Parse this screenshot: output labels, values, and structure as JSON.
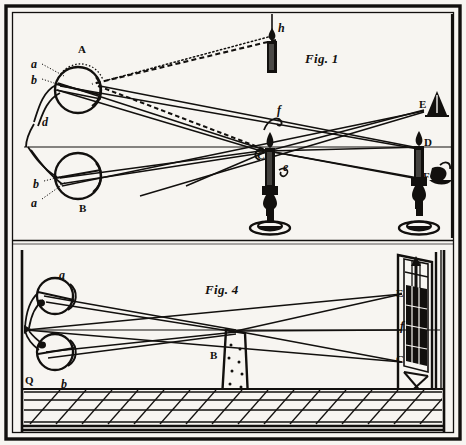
{
  "plate": {
    "title": "Optical diagram plate with two figures",
    "background_color": "#f7f5f1",
    "ink_color": "#12100e",
    "border": {
      "outer_stroke": 3,
      "inner_stroke": 1.2
    }
  },
  "figures": [
    {
      "id": "fig1",
      "caption": "Fig. 1",
      "caption_pos": {
        "x": 305,
        "y": 58
      },
      "description": "Two eyes at left viewing candles; rays converge at candle C",
      "labels": [
        {
          "name": "eye-a-upper",
          "text": "a",
          "style": "italic",
          "x": 31,
          "y": 64
        },
        {
          "name": "eye-b-upper",
          "text": "b",
          "style": "italic",
          "x": 31,
          "y": 80
        },
        {
          "name": "eye-A",
          "text": "A",
          "style": "capital",
          "x": 78,
          "y": 50
        },
        {
          "name": "eye-d",
          "text": "d",
          "style": "italic",
          "x": 42,
          "y": 122
        },
        {
          "name": "eye-b-lower",
          "text": "b",
          "style": "italic",
          "x": 33,
          "y": 184
        },
        {
          "name": "eye-a-lower",
          "text": "a",
          "style": "italic",
          "x": 31,
          "y": 203
        },
        {
          "name": "eye-B",
          "text": "B",
          "style": "capital",
          "x": 79,
          "y": 209
        },
        {
          "name": "candle-h",
          "text": "h",
          "style": "italic",
          "x": 276,
          "y": 27
        },
        {
          "name": "point-f",
          "text": "f",
          "style": "italic",
          "x": 276,
          "y": 110
        },
        {
          "name": "candle-C",
          "text": "C",
          "style": "capital",
          "x": 259,
          "y": 155
        },
        {
          "name": "point-e",
          "text": "e",
          "style": "italic",
          "x": 281,
          "y": 167
        },
        {
          "name": "lamp-E",
          "text": "E",
          "style": "capital",
          "x": 420,
          "y": 104
        },
        {
          "name": "candle-D",
          "text": "D",
          "style": "capital",
          "x": 424,
          "y": 142
        },
        {
          "name": "object-F",
          "text": "F",
          "style": "capital",
          "x": 423,
          "y": 177
        }
      ],
      "objects": [
        {
          "name": "eye-upper",
          "kind": "eyeball",
          "cx": 78,
          "cy": 90,
          "r": 23
        },
        {
          "name": "eye-lower",
          "kind": "eyeball",
          "cx": 78,
          "cy": 176,
          "r": 23
        },
        {
          "name": "hanging-candle-h",
          "kind": "candle",
          "x": 268,
          "y": 30
        },
        {
          "name": "table-candle-C",
          "kind": "candlestick",
          "x": 268,
          "y": 150
        },
        {
          "name": "table-candle-D",
          "kind": "candlestick",
          "x": 418,
          "y": 143
        },
        {
          "name": "wall-lamp-E",
          "kind": "cone-lamp",
          "x": 437,
          "y": 100
        },
        {
          "name": "wall-object-F",
          "kind": "small-lamp",
          "x": 436,
          "y": 178
        }
      ]
    },
    {
      "id": "fig4",
      "caption": "Fig. 4",
      "caption_pos": {
        "x": 205,
        "y": 288
      },
      "description": "Room in perspective with tiled floor, chair B and a window at right",
      "labels": [
        {
          "name": "eye-a-upper",
          "text": "a",
          "style": "italic",
          "x": 59,
          "y": 275
        },
        {
          "name": "eye-b-lower",
          "text": "b",
          "style": "italic",
          "x": 61,
          "y": 384
        },
        {
          "name": "corner-Q",
          "text": "Q",
          "style": "capital",
          "x": 23,
          "y": 380
        },
        {
          "name": "chair-B",
          "text": "B",
          "style": "capital",
          "x": 210,
          "y": 356
        },
        {
          "name": "window-E",
          "text": "E",
          "style": "capital",
          "x": 398,
          "y": 294
        },
        {
          "name": "window-f",
          "text": "f",
          "style": "italic",
          "x": 400,
          "y": 326
        },
        {
          "name": "window-C",
          "text": "C",
          "style": "capital",
          "x": 398,
          "y": 360
        }
      ],
      "objects": [
        {
          "name": "eye-upper",
          "kind": "eyeball",
          "cx": 55,
          "cy": 296,
          "r": 18
        },
        {
          "name": "eye-lower",
          "kind": "eyeball",
          "cx": 55,
          "cy": 352,
          "r": 18
        },
        {
          "name": "chair",
          "kind": "high-back-chair",
          "x": 222,
          "y": 330
        },
        {
          "name": "window",
          "kind": "sash-window",
          "x": 412,
          "y": 255
        },
        {
          "name": "floor",
          "kind": "tiled-floor-perspective",
          "y": 388
        }
      ]
    }
  ]
}
